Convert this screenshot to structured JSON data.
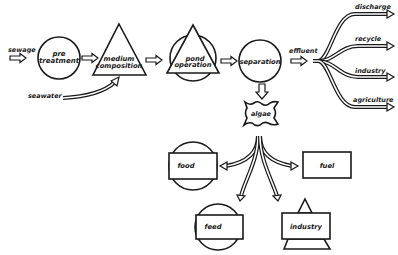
{
  "diagram": {
    "type": "process-flow",
    "nodes": {
      "sewage": "sewage",
      "seawater": "seawater",
      "pre_treatment": [
        "pre",
        "treatment"
      ],
      "medium_composition": [
        "medium",
        "composition"
      ],
      "pond_operation": [
        "pond",
        "operation"
      ],
      "separation": "separation",
      "effluent": "effluent",
      "algae": "algae"
    },
    "effluent_outputs": [
      "discharge",
      "recycle",
      "industry",
      "agriculture"
    ],
    "algae_products": {
      "food": "food",
      "fuel": "fuel",
      "feed": "feed",
      "industry": "industry"
    },
    "edges": [
      [
        "sewage",
        "pre_treatment"
      ],
      [
        "pre_treatment",
        "medium_composition"
      ],
      [
        "seawater",
        "medium_composition"
      ],
      [
        "medium_composition",
        "pond_operation"
      ],
      [
        "pond_operation",
        "separation"
      ],
      [
        "separation",
        "effluent"
      ],
      [
        "separation",
        "algae"
      ],
      [
        "effluent",
        "discharge"
      ],
      [
        "effluent",
        "recycle"
      ],
      [
        "effluent",
        "industry"
      ],
      [
        "effluent",
        "agriculture"
      ],
      [
        "algae",
        "food"
      ],
      [
        "algae",
        "fuel"
      ],
      [
        "algae",
        "feed"
      ],
      [
        "algae",
        "industry"
      ]
    ]
  }
}
